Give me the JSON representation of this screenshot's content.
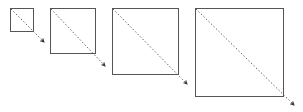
{
  "diagram": {
    "colors": {
      "box_stroke": "#555555",
      "arrow_line": "#666666",
      "arrowhead": "#333333",
      "background": "#ffffff"
    },
    "squares": [
      {
        "x": 10,
        "y": 8,
        "size": 23,
        "arrow_end": [
          44,
          42
        ]
      },
      {
        "x": 50,
        "y": 8,
        "size": 45,
        "arrow_end": [
          105,
          66
        ]
      },
      {
        "x": 112,
        "y": 8,
        "size": 66,
        "arrow_end": [
          187,
          84
        ]
      },
      {
        "x": 195,
        "y": 8,
        "size": 88,
        "arrow_end": [
          294,
          105
        ]
      }
    ]
  }
}
